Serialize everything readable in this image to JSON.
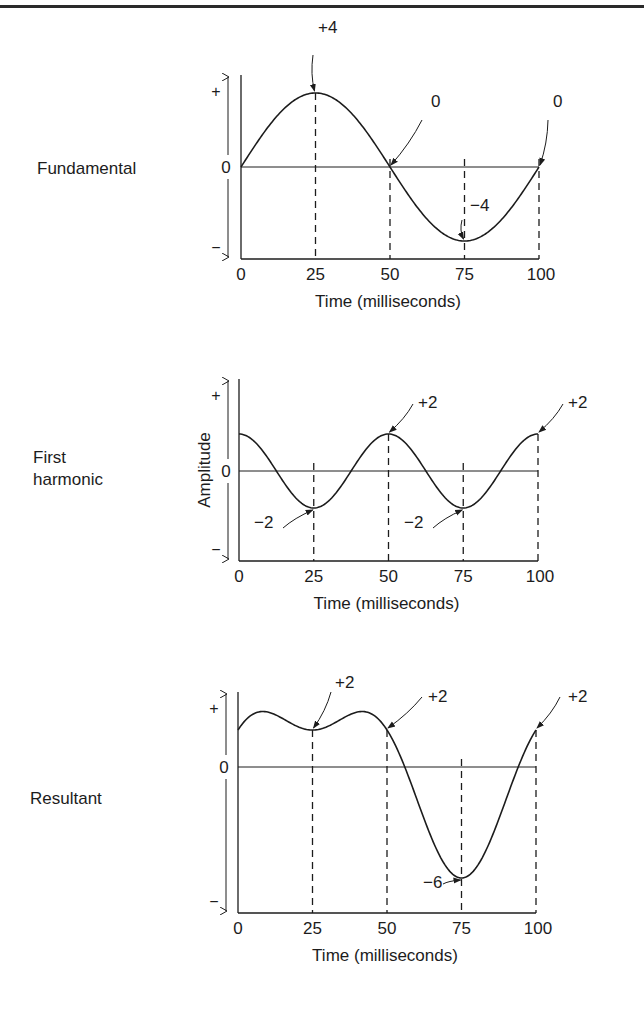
{
  "chart_data": [
    {
      "type": "line",
      "id": "fundamental",
      "row_label": [
        "Fundamental"
      ],
      "title": "Fundamental",
      "xlabel": "Time (milliseconds)",
      "ylabel": "",
      "x_ticks": [
        "0",
        "25",
        "50",
        "75",
        "100"
      ],
      "y_ticks": [
        "+",
        "0",
        "−"
      ],
      "xlim": [
        0,
        100
      ],
      "ylim": [
        -4.8,
        4.8
      ],
      "x": [
        0,
        25,
        50,
        75,
        100
      ],
      "series": [
        {
          "name": "Fundamental",
          "formula": "4*sin(2*pi*t/100)",
          "values": [
            0,
            4,
            0,
            -4,
            0
          ]
        }
      ],
      "annotations": [
        {
          "text": "+4",
          "x": 25,
          "y": 4
        },
        {
          "text": "0",
          "x": 50,
          "y": 0
        },
        {
          "text": "−4",
          "x": 75,
          "y": -4
        },
        {
          "text": "0",
          "x": 100,
          "y": 0
        }
      ],
      "dashed_guides_at": [
        25,
        50,
        75,
        100
      ]
    },
    {
      "type": "line",
      "id": "first-harmonic",
      "row_label": [
        "First",
        "harmonic"
      ],
      "title": "First harmonic",
      "xlabel": "Time (milliseconds)",
      "ylabel": "Amplitude",
      "x_ticks": [
        "0",
        "25",
        "50",
        "75",
        "100"
      ],
      "y_ticks": [
        "+",
        "0",
        "−"
      ],
      "xlim": [
        0,
        100
      ],
      "ylim": [
        -4.8,
        4.8
      ],
      "x": [
        0,
        25,
        50,
        75,
        100
      ],
      "series": [
        {
          "name": "First harmonic",
          "formula": "2*cos(4*pi*t/100)",
          "values": [
            2,
            -2,
            2,
            -2,
            2
          ]
        }
      ],
      "annotations": [
        {
          "text": "−2",
          "x": 25,
          "y": -2
        },
        {
          "text": "+2",
          "x": 50,
          "y": 2
        },
        {
          "text": "−2",
          "x": 75,
          "y": -2
        },
        {
          "text": "+2",
          "x": 100,
          "y": 2
        }
      ],
      "dashed_guides_at": [
        25,
        50,
        75,
        100
      ]
    },
    {
      "type": "line",
      "id": "resultant",
      "row_label": [
        "Resultant"
      ],
      "title": "Resultant",
      "xlabel": "Time (milliseconds)",
      "ylabel": "",
      "x_ticks": [
        "0",
        "25",
        "50",
        "75",
        "100"
      ],
      "y_ticks": [
        "+",
        "0",
        "−"
      ],
      "xlim": [
        0,
        100
      ],
      "ylim": [
        -7.6,
        4.8
      ],
      "x": [
        0,
        25,
        50,
        75,
        100
      ],
      "series": [
        {
          "name": "Resultant (fundamental + first harmonic)",
          "values": [
            2,
            2,
            2,
            -6,
            2
          ]
        }
      ],
      "annotations": [
        {
          "text": "+2",
          "x": 25,
          "y": 2
        },
        {
          "text": "+2",
          "x": 50,
          "y": 2
        },
        {
          "text": "−6",
          "x": 75,
          "y": -6
        },
        {
          "text": "+2",
          "x": 100,
          "y": 2
        }
      ],
      "dashed_guides_at": [
        25,
        50,
        75,
        100
      ]
    }
  ],
  "labels": {
    "fundamental": "Fundamental",
    "first_harmonic_line1": "First",
    "first_harmonic_line2": "harmonic",
    "resultant": "Resultant",
    "amplitude": "Amplitude",
    "xlabel": "Time (milliseconds)"
  }
}
